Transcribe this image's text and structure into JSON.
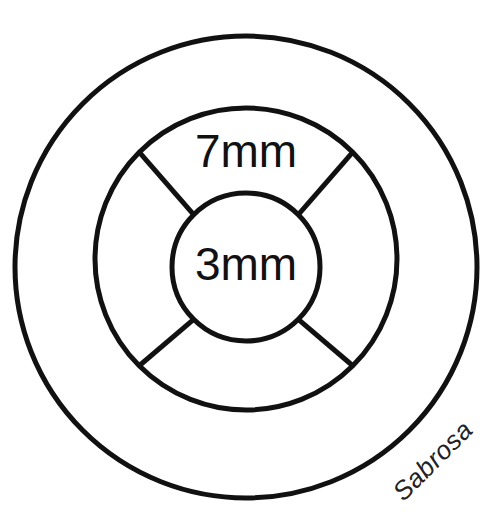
{
  "canvas": {
    "width": 492,
    "height": 526,
    "background_color": "#ffffff",
    "stroke_color": "#111111"
  },
  "diagram": {
    "title_alt": "concentric ring cross-section diagram",
    "labels": {
      "outer_ring_label": "7mm",
      "inner_circle_label": "3mm"
    },
    "signature": "Sabrosa"
  },
  "chart_data": {
    "type": "diagram",
    "title": "",
    "annotations": [
      {
        "text": "7mm",
        "ring": "middle-band",
        "x": 246,
        "y": 155,
        "font_size": 46
      },
      {
        "text": "3mm",
        "ring": "inner-core",
        "x": 246,
        "y": 268,
        "font_size": 46
      },
      {
        "text": "Sabrosa",
        "ring": "outer-band",
        "x": 434,
        "y": 462,
        "font_size": 26,
        "rotation": -45
      }
    ],
    "circles": [
      {
        "name": "outer-circle",
        "cx": 246,
        "cy": 267,
        "r": 231,
        "stroke_width": 5,
        "fill": "none"
      },
      {
        "name": "middle-circle",
        "cx": 246,
        "cy": 259,
        "r": 151,
        "stroke_width": 5,
        "fill": "none"
      },
      {
        "name": "inner-circle",
        "cx": 246,
        "cy": 267,
        "r": 74,
        "stroke_width": 5,
        "fill": "none"
      }
    ],
    "spokes": [
      {
        "name": "spoke-upper-left",
        "angle_deg": 225,
        "inner_r": 74,
        "outer_r": 151,
        "stroke_width": 5
      },
      {
        "name": "spoke-upper-right",
        "angle_deg": 315,
        "inner_r": 74,
        "outer_r": 151,
        "stroke_width": 5
      },
      {
        "name": "spoke-lower-right",
        "angle_deg": 45,
        "inner_r": 74,
        "outer_r": 151,
        "stroke_width": 5
      },
      {
        "name": "spoke-lower-left",
        "angle_deg": 135,
        "inner_r": 74,
        "outer_r": 151,
        "stroke_width": 5
      }
    ],
    "colors": {
      "stroke": "#111111",
      "background": "#ffffff"
    },
    "xlim": [
      0,
      492
    ],
    "ylim": [
      0,
      526
    ],
    "grid": false,
    "legend": null
  }
}
